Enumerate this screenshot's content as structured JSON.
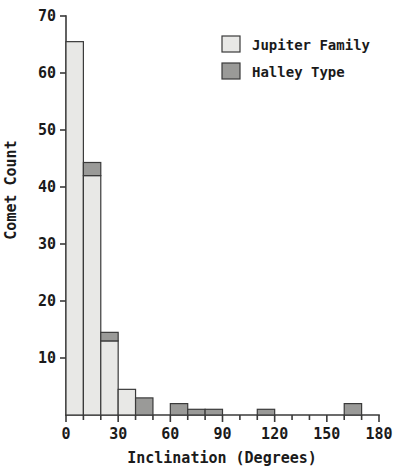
{
  "chart_data": {
    "type": "bar",
    "subtype": "stacked-histogram",
    "title": "",
    "subtitle": "",
    "xlabel": "Inclination  (Degrees)",
    "ylabel": "Comet Count",
    "xlim": [
      0,
      180
    ],
    "ylim": [
      0,
      70
    ],
    "bin_width": 10,
    "xticks": [
      "0",
      "30",
      "60",
      "90",
      "120",
      "150",
      "180"
    ],
    "xtick_values": [
      0,
      30,
      60,
      90,
      120,
      150,
      180
    ],
    "xminor_tick_values": [
      10,
      20,
      40,
      50,
      70,
      80,
      100,
      110,
      130,
      140,
      160,
      170
    ],
    "yticks": [
      "10",
      "20",
      "30",
      "40",
      "50",
      "60",
      "70"
    ],
    "ytick_values": [
      10,
      20,
      30,
      40,
      50,
      60,
      70
    ],
    "grid": false,
    "legend_position": "top-right",
    "bin_starts": [
      0,
      10,
      20,
      30,
      40,
      50,
      60,
      70,
      80,
      90,
      100,
      110,
      120,
      130,
      140,
      150,
      160,
      170
    ],
    "series": [
      {
        "name": "Jupiter Family",
        "color": "#e8e8e6",
        "values": [
          65.5,
          42,
          13,
          4.5,
          0,
          0,
          0,
          0,
          0,
          0,
          0,
          0,
          0,
          0,
          0,
          0,
          0,
          0
        ]
      },
      {
        "name": "Halley Type",
        "color": "#9a9a98",
        "values": [
          0,
          2.3,
          1.5,
          0,
          3,
          0,
          2,
          1,
          1,
          0,
          0,
          1,
          0,
          0,
          0,
          0,
          2,
          0
        ]
      }
    ]
  },
  "legend": {
    "entries": [
      {
        "label": "Jupiter Family",
        "color": "#e8e8e6",
        "swatch_name": "legend-swatch-jupiter-family"
      },
      {
        "label": "Halley Type",
        "color": "#9a9a98",
        "swatch_name": "legend-swatch-halley-type"
      }
    ]
  },
  "colors": {
    "jupiter_family": "#e8e8e6",
    "halley_type": "#9a9a98",
    "axis": "#3a3a3a",
    "text": "#1a1a1a",
    "background": "#ffffff"
  }
}
